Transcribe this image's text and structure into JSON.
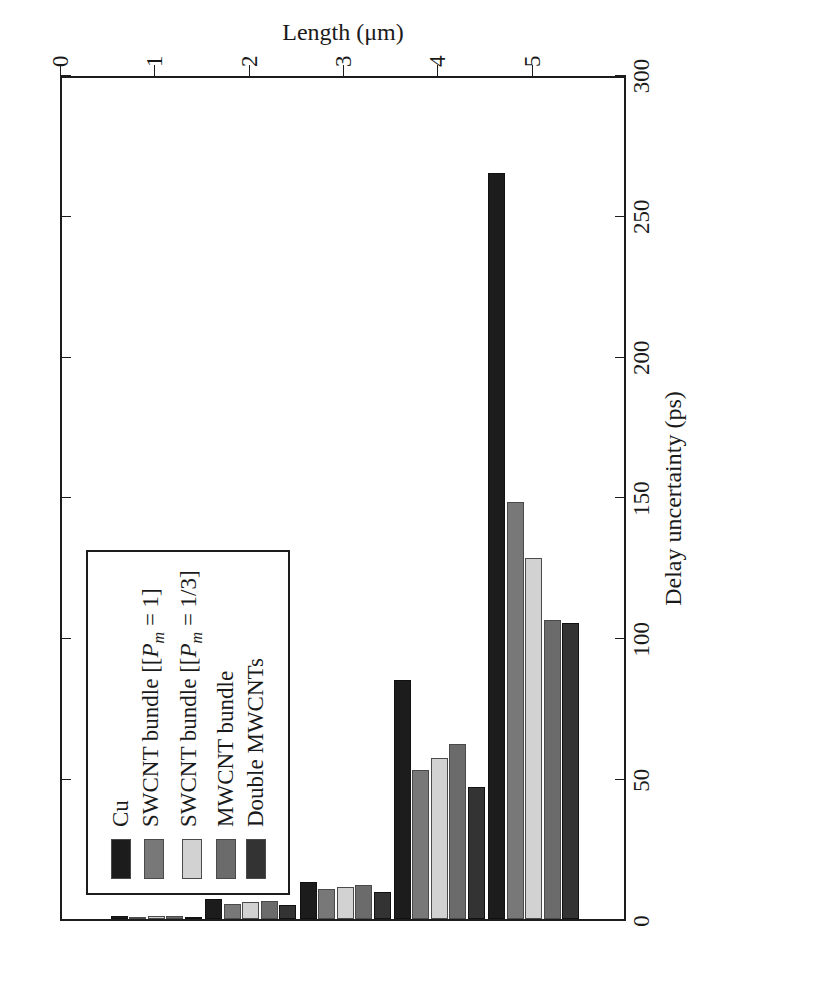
{
  "chart_data": {
    "type": "bar",
    "orientation": "horizontal-rotated",
    "title": "",
    "xlabel": "Length (µm)",
    "ylabel": "Delay uncertainty (ps)",
    "categories": [
      "1",
      "2",
      "3",
      "4",
      "5"
    ],
    "x_tick_labels": [
      "0",
      "1",
      "2",
      "3",
      "4",
      "5"
    ],
    "y_tick_labels": [
      "0",
      "50",
      "100",
      "150",
      "200",
      "250",
      "300"
    ],
    "ylim": [
      0,
      300
    ],
    "y_tick_step": 50,
    "grid": false,
    "legend_position": "upper-left",
    "series": [
      {
        "name": "Cu",
        "color": "#1c1c1c",
        "values": [
          1.2,
          7.0,
          13.0,
          85.0,
          265.0
        ]
      },
      {
        "name": "SWCNT bundle [Pm = 1]",
        "color": "#787878",
        "values": [
          0.8,
          5.5,
          10.5,
          53.0,
          148.0
        ]
      },
      {
        "name": "SWCNT bundle [Pm = 1/3]",
        "color": "#d2d2d2",
        "values": [
          0.9,
          6.0,
          11.5,
          57.0,
          128.0
        ]
      },
      {
        "name": "MWCNT bundle",
        "color": "#6b6b6b",
        "values": [
          1.0,
          6.3,
          12.0,
          62.0,
          106.0
        ]
      },
      {
        "name": "Double MWCNTs",
        "color": "#333333",
        "values": [
          0.7,
          5.0,
          9.5,
          47.0,
          105.0
        ]
      }
    ]
  },
  "legend": {
    "items": [
      {
        "label": "Cu",
        "label_plain": "Cu",
        "color": "#1c1c1c"
      },
      {
        "label": "SWCNT bundle [P",
        "label_plain": "SWCNT bundle [Pm = 1]",
        "color": "#787878",
        "sub": "m",
        "tail": " = 1]"
      },
      {
        "label": "SWCNT bundle [P",
        "label_plain": "SWCNT bundle [Pm = 1/3]",
        "color": "#d2d2d2",
        "sub": "m",
        "tail": " = 1/3]"
      },
      {
        "label": "MWCNT bundle",
        "label_plain": "MWCNT bundle",
        "color": "#6b6b6b"
      },
      {
        "label": "Double MWCNTs",
        "label_plain": "Double MWCNTs",
        "color": "#333333"
      }
    ]
  },
  "axes": {
    "y_title": "Delay uncertainty (ps)",
    "x_title": "Length (μm)",
    "y_ticks": [
      300,
      250,
      200,
      150,
      100,
      50,
      0
    ],
    "x_ticks": [
      0,
      1,
      2,
      3,
      4,
      5
    ]
  }
}
